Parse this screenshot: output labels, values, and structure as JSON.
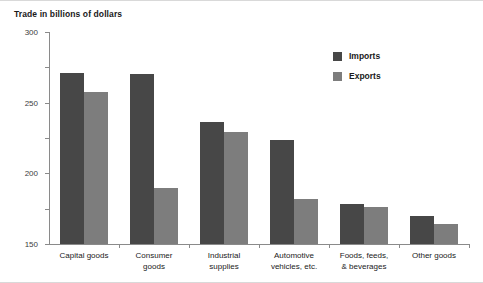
{
  "chart_data": {
    "type": "bar",
    "title": "Trade in billions of dollars",
    "xlabel": "",
    "ylabel": "",
    "ylim": [
      0,
      300
    ],
    "yticks": [
      0,
      50,
      100,
      150,
      200,
      250,
      300
    ],
    "grid": false,
    "legend_position": "top-right",
    "categories": [
      "Capital goods",
      "Consumer goods",
      "Industrial supplies",
      "Automotive vehicles, etc.",
      "Foods, feeds, & beverages",
      "Other goods"
    ],
    "category_lines": [
      [
        "Capital goods"
      ],
      [
        "Consumer",
        "goods"
      ],
      [
        "Industrial",
        "supplies"
      ],
      [
        "Automotive",
        "vehicles, etc."
      ],
      [
        "Foods, feeds,",
        "& beverages"
      ],
      [
        "Other goods"
      ]
    ],
    "series": [
      {
        "name": "Imports",
        "color": "#474747",
        "values": [
          242,
          241,
          172,
          147,
          56,
          39
        ]
      },
      {
        "name": "Exports",
        "color": "#7d7d7d",
        "values": [
          215,
          79,
          158,
          64,
          52,
          29
        ]
      }
    ]
  },
  "style": {
    "axis_color": "#8a8a8a",
    "text_color": "#1a1a1a",
    "background": "#ffffff"
  }
}
